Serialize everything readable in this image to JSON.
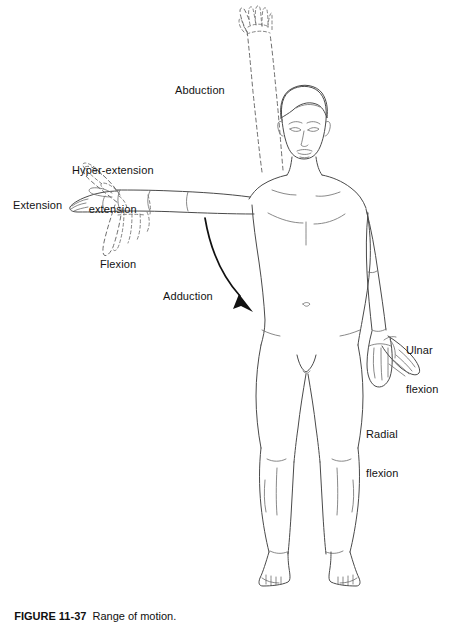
{
  "figure": {
    "type": "anatomical-line-drawing",
    "view": "anterior full-body male figure",
    "caption_number": "FIGURE 11-37",
    "caption_text": "Range of motion.",
    "caption_full": "FIGURE 11-37  Range of motion.",
    "background_color": "#ffffff",
    "line_color": "#4a4a4a",
    "dashed_line_color": "#6e6e6e",
    "arrow_color": "#111111",
    "text_color": "#131313"
  },
  "labels": [
    {
      "id": "abduction",
      "text": "Abduction",
      "x": 175,
      "y": 84,
      "describes": "dashed raised arm overhead, shoulder abduction"
    },
    {
      "id": "hyper-extension",
      "line1": "Hyper-extension",
      "line2": "extension",
      "text": "Hyper-extension\nextension",
      "x": 72,
      "y": 138,
      "describes": "dashed hand bent upward above wrist"
    },
    {
      "id": "extension",
      "text": "Extension",
      "x": 13,
      "y": 199,
      "describes": "solid hand in neutral straight position"
    },
    {
      "id": "flexion",
      "text": "Flexion",
      "x": 100,
      "y": 258,
      "describes": "dashed hand bent downward below wrist"
    },
    {
      "id": "adduction",
      "text": "Adduction",
      "x": 163,
      "y": 290,
      "describes": "curved arrow sweeping arm down toward body"
    },
    {
      "id": "ulnar-flexion",
      "line1": "Ulnar",
      "line2": "flexion",
      "text": "Ulnar\nflexion",
      "x": 406,
      "y": 318,
      "describes": "hand deviated laterally away from body"
    },
    {
      "id": "radial-flexion",
      "line1": "Radial",
      "line2": "flexion",
      "text": "Radial\nflexion",
      "x": 366,
      "y": 402,
      "describes": "hand deviated medially toward thumb side"
    }
  ],
  "annotations": {
    "adduction_arrow": {
      "name": "adduction-arrow",
      "style": "curved solid arrow with filled head",
      "direction": "down-right"
    }
  }
}
